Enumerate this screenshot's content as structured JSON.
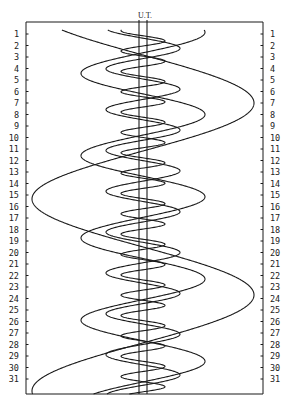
{
  "chart_data": {
    "type": "line",
    "header_label": "U.T.",
    "row_labels": [
      "1",
      "2",
      "3",
      "4",
      "5",
      "6",
      "7",
      "8",
      "9",
      "10",
      "11",
      "12",
      "13",
      "14",
      "15",
      "16",
      "17",
      "18",
      "19",
      "20",
      "21",
      "22",
      "23",
      "24",
      "25",
      "26",
      "27",
      "28",
      "29",
      "30",
      "31"
    ],
    "frame": {
      "left": 26,
      "top": 22,
      "right": 263,
      "bottom": 394
    },
    "center_x": 143,
    "planet_band": {
      "left": 139,
      "right": 147
    },
    "row_start_y": 34,
    "row_spacing": 11.5,
    "series": [
      {
        "name": "Io",
        "amplitude": 22,
        "period_days": 1.769,
        "phase_day_of_east_elongation": 1.6
      },
      {
        "name": "Europa",
        "amplitude": 37,
        "period_days": 3.551,
        "phase_day_of_east_elongation": 2.25
      },
      {
        "name": "Ganymede",
        "amplitude": 62,
        "period_days": 7.155,
        "phase_day_of_east_elongation": 8.0
      },
      {
        "name": "Callisto",
        "amplitude": 111,
        "period_days": 16.69,
        "phase_day_of_east_elongation": 7.0
      }
    ],
    "xlabel": "",
    "ylabel": "Day of month",
    "grid": false
  },
  "colors": {
    "line": "#1a1a1a",
    "background": "#ffffff"
  }
}
